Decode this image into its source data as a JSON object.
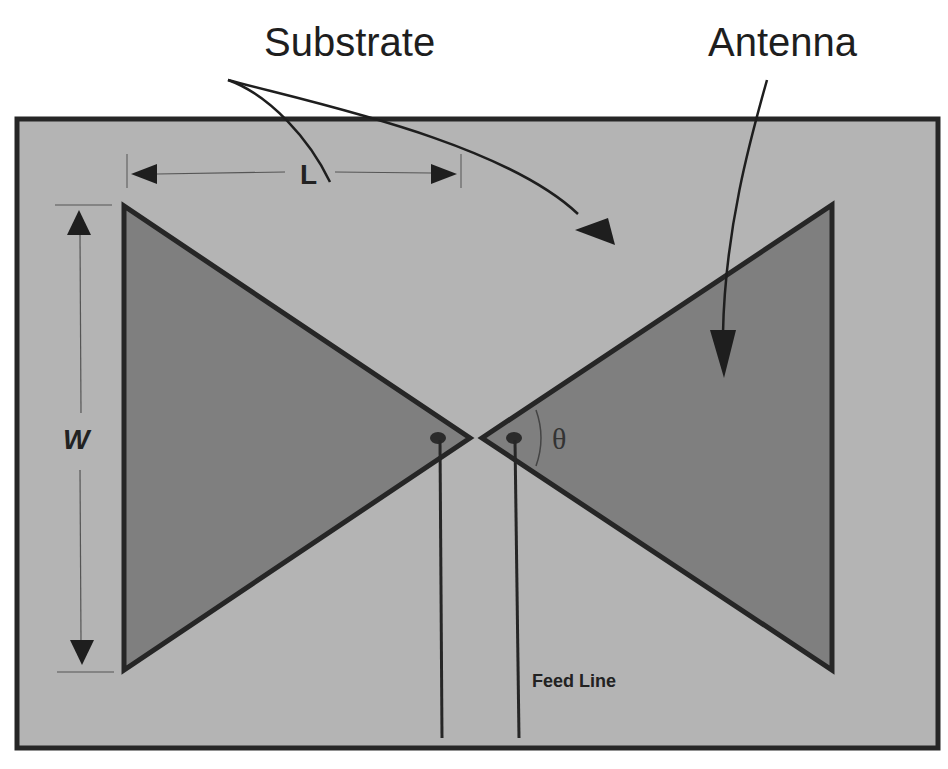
{
  "diagram": {
    "type": "bowtie-antenna-schematic",
    "labels": {
      "substrate": "Substrate",
      "antenna": "Antenna",
      "length": "L",
      "width": "W",
      "angle": "θ",
      "feed_line": "Feed Line"
    },
    "colors": {
      "background": "#ffffff",
      "substrate_fill": "#b4b4b4",
      "antenna_fill": "#7f7f7f",
      "outline": "#262626"
    }
  }
}
